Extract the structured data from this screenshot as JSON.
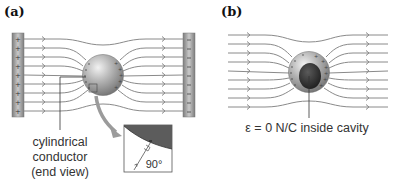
{
  "panels": {
    "a": {
      "label": "(a)",
      "caption_lines": [
        "cylindrical",
        "conductor",
        "(end view)"
      ],
      "left_plate": {
        "charge_symbol": "+",
        "count": 9
      },
      "right_plate": {
        "charge_symbol": "–",
        "count": 9
      },
      "inset": {
        "charge_symbol": "–",
        "angle_label": "90°"
      }
    },
    "b": {
      "label": "(b)",
      "caption": "ε = 0 N/C inside cavity"
    }
  },
  "colors": {
    "field_line": "#8a8a8a",
    "plate": "#9a9a9a",
    "conductor": "#a0a0a0",
    "cavity": "#3a3a3a",
    "callout_arrow": "#9b9b9b"
  }
}
